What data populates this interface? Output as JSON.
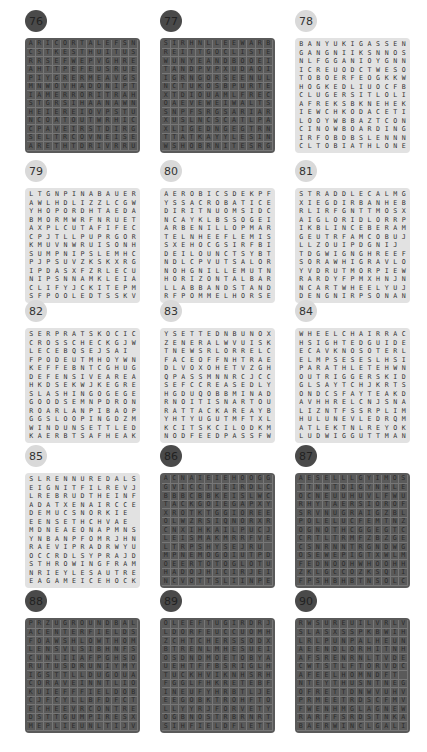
{
  "page": {
    "layout": {
      "columns": 3,
      "rows": 5
    },
    "colors": {
      "dark_grid": "#5a5a5a",
      "light_grid": "#e2e2e2",
      "dark_badge": "#4a4a4a",
      "light_badge": "#d9d9d9"
    }
  },
  "puzzles": [
    {
      "number": "76",
      "theme": "dark",
      "x": 25,
      "y": 10,
      "rows": [
        "ARICORTALEFSN",
        "CSTKESTHUITUS",
        "RRSEFWEPVGHRE",
        "AHTTPEFEUSRUE",
        "PIYGRERMEAVGS",
        "MNWOVHADONIPT",
        "IAMERRORITRAH",
        "STGRSIHAANAWN",
        "HEIEREIOVPSTU",
        "NCOATOUTWRHIC",
        "CPAVEIRSTDIRG",
        "SELTRCOVNEISE",
        "ARETHTDRIVRRU"
      ]
    },
    {
      "number": "77",
      "theme": "dark",
      "x": 160,
      "y": 10,
      "rows": [
        "SIRHNLLEEWARB",
        "REITTGOCLISTE",
        "WUNYEANDBOOEI",
        "TANDPVPXUDAOI",
        "IGRNGORSEENUL",
        "NCTUKOSBPURTE",
        "XTDIOUAMLFREC",
        "OAEVEWEIWALTS",
        "SNPFSRGSARIAR",
        "XUSLNCSCATLPA",
        "XLIGEDNGEGTRN",
        "TTATKAYYLESIN",
        "WSHOBRNITESRG"
      ]
    },
    {
      "number": "78",
      "theme": "light",
      "x": 295,
      "y": 10,
      "rows": [
        "BANYUKIGASSEN",
        "GANGNIIKSNNOS",
        "NLFGGANIOYGNN",
        "ICREUODCTWESO",
        "TOBOERFEOGKKW",
        "HOGKEDLIUOCFB",
        "CLUGERSITLOLI",
        "AFREKSBKNEHEK",
        "IEWCHKODACETI",
        "LOOYWBBAZTCON",
        "CINOWBOARDING",
        "IRFOBDBSLENNN",
        "CLTOBIATHLONE"
      ]
    },
    {
      "number": "79",
      "theme": "light",
      "x": 25,
      "y": 160,
      "rows": [
        "LTGNPINABAUER",
        "AWLHDLIZZLCGW",
        "YHOPORDHTAEDA",
        "BMORMWRFNRUET",
        "AXPLCUTAFIFEC",
        "CPJTLLPUPRGOR",
        "KMUVNWRUISONH",
        "SUMPNIPSLEMHC",
        "PJPSUVZKSKXRG",
        "IPDASXFZRLECU",
        "NIPSNNAMKLEIA",
        "CLIFYJCKITEPM",
        "SFPOOLEDTSSKV"
      ]
    },
    {
      "number": "80",
      "theme": "light",
      "x": 160,
      "y": 160,
      "rows": [
        "AEROBICSDEKPFN",
        "YSSACROBATICE",
        "DIRITNUOMSIDC",
        "NCAYKLBSSOGEI",
        "ARBENILLOPMART",
        "TELNHEEFLEMIS",
        "SXEHOCGSIRFBI",
        "DEILOUNCTSYBT",
        "NDLCPVUTSALOR",
        "NOHGNILLEMUTNA",
        "HORIZONTALBAR",
        "LLABBANDSTAND",
        "RFPOMMELHORSE"
      ]
    },
    {
      "number": "81",
      "theme": "light",
      "x": 295,
      "y": 160,
      "rows": [
        "STRADDLECALMG",
        "XIEGDIRBANHEB",
        "RLIRFGNTTMOSX",
        "AIGLORIDLORRP",
        "IKBLINCEBERAM",
        "GEUTRFAMCOBUJ",
        "LLZOUIPDGNIJ",
        "TDGWIGNGHREEF",
        "SORAWHIGRAVLO",
        "YVDRUTMORPIEW",
        "RARDYFPMXHNJN",
        "NCARTWHEELYUJ",
        "DENGNIRPSONAN"
      ]
    },
    {
      "number": "82",
      "theme": "light",
      "x": 25,
      "y": 300,
      "rows": [
        "SERPRATSKOCIC",
        "CROSSCHECKGJW",
        "LECEBQSEJSAI",
        "FPODEUTMHOYWN",
        "KEFFEBNTCGHUG",
        "DEFENSIVEAREA",
        "HKDSEKWJKEGRE",
        "SLASHINGOGEGE",
        "GOODSEMNPDRON",
        "ROARLANPIBAOP",
        "GGSLOOPINGDZM",
        "WINDUNSETTLED",
        "KAERBTSAFHEAK"
      ]
    },
    {
      "number": "83",
      "theme": "light",
      "x": 160,
      "y": 300,
      "rows": [
        "YSETTEDNBUNOX",
        "ZENERALWVUISK",
        "TNEWSRLORRELC",
        "FACEOFFNHTRAE",
        "DLVOXOHETVZGH",
        "QPASSMNNRCJCC",
        "SEFCCREASEDLY",
        "HGDUQOBBMINAD",
        "RNOITISNARTOU",
        "RATTACKAREAYB",
        "YHTYUGUTMFTXL",
        "KCITSKCILODKM",
        "NODFEEDPASSFW"
      ]
    },
    {
      "number": "84",
      "theme": "light",
      "x": 295,
      "y": 300,
      "rows": [
        "WHEELCHAIRRACE",
        "HSIGHTEDGUIDEB",
        "ECAVKNOSOTERL",
        "ELMPSESESLHSI",
        "PARATHLETEHWN",
        "OUTRIGGERSKID",
        "GLSAYTCHJKRTS",
        "ONDCSFAYTEAKD",
        "AVHHRELCNJSNAHC",
        "LIZNTFSSRPLIMC",
        "HULUNEVLEDRQM",
        "ATLEKTNLREYOK",
        "LUDWIGGUTTMANN",
        "LSZZLLASTOOTSC"
      ]
    },
    {
      "number": "85",
      "theme": "light",
      "x": 25,
      "y": 445,
      "rows": [
        "SLRENNUREDALS",
        "EIGNITFILREVJ",
        "LREBRUDTHEINF",
        "ADATXENAIRCCE",
        "DEMUCSNORKIE",
        "EENSETHCHVAE",
        "MDNEAEONAPMNS",
        "YNBANPFOMRJHNN",
        "RAEVIPRADRWYUA",
        "OCCRDLSYPRAJD",
        "STHROWINGFRAME",
        "NRIEYLESAUTRES",
        "EAGAMEICEHOCKEY",
        "SCIIPMYLFAEDTLC"
      ]
    },
    {
      "number": "86",
      "theme": "dark",
      "x": 160,
      "y": 445,
      "rows": [
        "ACNAIEIEHOOGGIR",
        "GVICCTLEIRDLC",
        "BBBCBBKEISLWCO",
        "TACKGOIEGAPXYV",
        "XROTKTGGIOREE",
        "OLWZRSIQNORXR",
        "CNXIHKAILPUCJM",
        "LEISMAKMRRFVE",
        "LTRPSHYSEJRU",
        "MPNEMOGOIUTPDA",
        "OEERTOTOGLOTUMK",
        "HADOJHICIRJEIJI",
        "NCVOTTSLIINPEC",
        "OIIDDCLIBSORKIC"
      ]
    },
    {
      "number": "87",
      "theme": "dark",
      "x": 295,
      "y": 445,
      "rows": [
        "AESELLLGYIMOSE",
        "TTNNTDIGYNHLEYR",
        "OCNEUUHUVLFWUHN",
        "RHYTAERSIOROF",
        "SRVNUGRAIGZBL",
        "POLELUCFEMTNZN",
        "OGNOTHCGGEGTC",
        "CRTLTRMFZBZGEIK",
        "CSNRNNTRGNDWG",
        "OSEWEPIGTXWLMU",
        "FEDNOOHWHOOHHGDS",
        "ZKLGCCOZKSQTIIOU",
        "FPSHBHBTNSOLCA",
        "BUMOOCLXRSPNOKK"
      ]
    },
    {
      "number": "88",
      "theme": "dark",
      "x": 25,
      "y": 590,
      "rows": [
        "PRZUGROUNDBALL",
        "ACENTERFIELDSX",
        "FOAWSHLOWTHOMO",
        "LENSVLSIBHNFS",
        "CUNLIIAFPGHSO",
        "RUTUSDRUNIYMYR",
        "IGSTTLLDUGOUAYE",
        "CORAVEINNTLIOT",
        "KUIEFFFIELDOBT",
        "CJFCYLLBFDFCTM",
        "ECHEEVRCONTRE",
        "DSTTGUMPIRESXBU",
        "MEPLIEUNLTIJVWE",
        "OPOTETRONSLZMW"
      ]
    },
    {
      "number": "89",
      "theme": "dark",
      "x": 160,
      "y": 590,
      "rows": [
        "OLEEFTUGIRDRJN",
        "LDORFEUCCUOMHM",
        "ZCHTCHERSSODXT",
        "BTRENLMHESUEIV",
        "OSDNDMOETOBYAN",
        "UEHTFFBSRIGLHMR",
        "TUCKHVIKNHSRHSD",
        "FGGLFHKRETEBFRR",
        "INEUFYHRBTLJEFR",
        "EEGOBKTROHFTOAHH",
        "LLYYRJFORVETYCE",
        "OGBNOSTRBRNRTH",
        "SIHFIELDFLETTR",
        "CXXJJMWSEIGZPY"
      ]
    },
    {
      "number": "90",
      "theme": "dark",
      "x": 295,
      "y": 590,
      "rows": [
        "RWSUREUILVRLVH",
        "SLASXSSPKBWIHB",
        "LRLPUNPALHEUNAK",
        "AEENDLORHITNHC",
        "AFSRENRNLTVDE",
        "CWTSTLFTORVDC",
        "AFEELHOMNDFT",
        "NTEYTHUSNTNEGSE",
        "OFRETTDNWVUHVE",
        "PRMEETRDSCFMVDR",
        "FWENHMGLAGNEWT",
        "RARFFSRDSTNKAPI",
        "BAERWINCLGALIOS",
        "DPMMRSIUDIVUGAS"
      ]
    }
  ]
}
